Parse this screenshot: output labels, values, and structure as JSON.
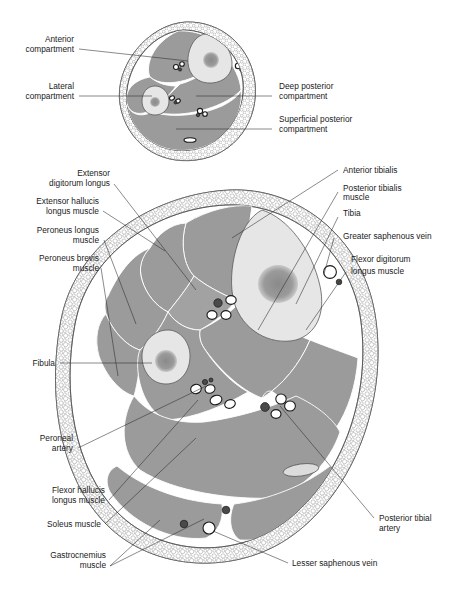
{
  "figure": {
    "title_fragment": "",
    "panels": [
      {
        "id": "upper",
        "name": "compartment-overview-cross-section"
      },
      {
        "id": "lower",
        "name": "detailed-leg-cross-section"
      }
    ]
  },
  "upper_panel": {
    "labels_left": [
      {
        "id": "anterior-compartment",
        "line1": "Anterior",
        "line2": "compartment"
      },
      {
        "id": "lateral-compartment",
        "line1": "Lateral",
        "line2": "compartment"
      }
    ],
    "labels_right": [
      {
        "id": "deep-posterior-compartment",
        "line1": "Deep posterior",
        "line2": "compartment"
      },
      {
        "id": "superficial-posterior-compartment",
        "line1": "Superficial posterior",
        "line2": "compartment"
      }
    ]
  },
  "lower_panel": {
    "labels_left": [
      {
        "id": "extensor-digitorum-longus",
        "line1": "Extensor",
        "line2": "digitorum longus"
      },
      {
        "id": "extensor-hallucis-longus-muscle",
        "line1": "Extensor hallucis",
        "line2": "longus muscle"
      },
      {
        "id": "peroneus-longus-muscle",
        "line1": "Peroneus longus",
        "line2": "muscle"
      },
      {
        "id": "peroneus-brevis-muscle",
        "line1": "Peroneus brevis",
        "line2": "muscle"
      },
      {
        "id": "fibula",
        "line1": "Fibula",
        "line2": ""
      },
      {
        "id": "peroneal-artery",
        "line1": "Peroneal",
        "line2": "artery"
      },
      {
        "id": "flexor-hallucis-longus-muscle",
        "line1": "Flexor hallucis",
        "line2": "longus muscle"
      },
      {
        "id": "soleus-muscle",
        "line1": "Soleus muscle",
        "line2": ""
      },
      {
        "id": "gastrocnemius-muscle",
        "line1": "Gastrocnemius",
        "line2": "muscle"
      }
    ],
    "labels_right": [
      {
        "id": "anterior-tibialis",
        "line1": "Anterior tibialis",
        "line2": ""
      },
      {
        "id": "posterior-tibialis-muscle",
        "line1": "Posterior tibialis",
        "line2": "muscle"
      },
      {
        "id": "tibia",
        "line1": "Tibia",
        "line2": ""
      },
      {
        "id": "greater-saphenous-vein",
        "line1": "Greater saphenous vein",
        "line2": ""
      },
      {
        "id": "flexor-digitorum-longus-muscle",
        "line1": "Flexor digitorum",
        "line2": "longus muscle"
      },
      {
        "id": "posterior-tibial-artery",
        "line1": "Posterior tibial",
        "line2": "artery"
      },
      {
        "id": "lesser-saphenous-vein",
        "line1": "Lesser saphenous vein",
        "line2": ""
      }
    ]
  },
  "colors": {
    "muscle_fill": "#9b9b9b",
    "bone_fill": "#e6e6e6",
    "marrow_fill": "#8e8e8e",
    "fat_stroke": "#9a9a9a",
    "outline_stroke": "#4a4a4a",
    "artery_fill": "#4a4a4a",
    "vein_fill": "#ffffff",
    "text": "#1a1a1a",
    "background": "#ffffff"
  }
}
